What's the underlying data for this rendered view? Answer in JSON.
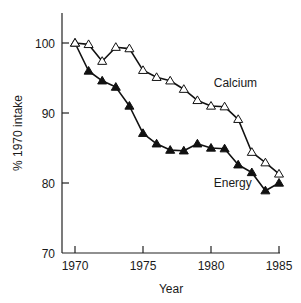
{
  "chart_data": {
    "type": "line",
    "title": "",
    "xlabel": "Year",
    "ylabel": "% 1970 intake",
    "xlim": [
      1970,
      1985
    ],
    "ylim": [
      70,
      100
    ],
    "grid": false,
    "x_ticks": [
      1970,
      1975,
      1980,
      1985
    ],
    "y_ticks": [
      70,
      80,
      90,
      100
    ],
    "x": [
      1970,
      1971,
      1972,
      1973,
      1974,
      1975,
      1976,
      1977,
      1978,
      1979,
      1980,
      1981,
      1982,
      1983,
      1984,
      1985
    ],
    "series": [
      {
        "name": "Calcium",
        "marker": "open-triangle",
        "values": [
          100,
          99.8,
          97.4,
          99.4,
          99.2,
          96.1,
          95.1,
          94.6,
          93.4,
          91.8,
          91.0,
          90.9,
          89.1,
          84.4,
          82.9,
          81.3
        ]
      },
      {
        "name": "Energy",
        "marker": "filled-triangle",
        "values": [
          100,
          96.0,
          94.6,
          93.7,
          91.0,
          87.1,
          85.6,
          84.7,
          84.6,
          85.6,
          85.0,
          84.9,
          82.6,
          81.5,
          78.9,
          80.0
        ]
      }
    ],
    "annotations": [
      {
        "text": "Calcium",
        "x": 1980.2,
        "y": 93.7
      },
      {
        "text": "Energy",
        "x": 1980.2,
        "y": 79.5
      }
    ],
    "legend": "inline labels"
  }
}
